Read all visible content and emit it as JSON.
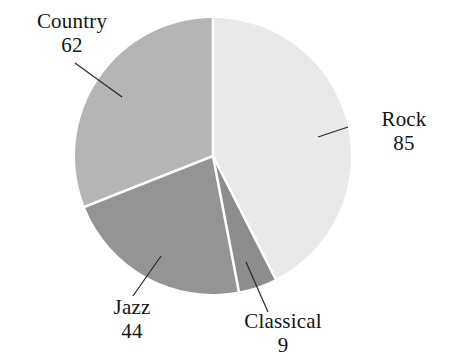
{
  "chart_data": {
    "type": "pie",
    "title": "",
    "subtitle": "",
    "xlabel": "",
    "ylabel": "",
    "categories": [
      "Rock",
      "Classical",
      "Jazz",
      "Country"
    ],
    "values": [
      85,
      9,
      44,
      62
    ],
    "total": 200,
    "start_angle_deg": 0,
    "direction": "clockwise",
    "legend": "none",
    "grid": false,
    "slices": [
      {
        "label": "Rock",
        "value": 85,
        "value_text": "85",
        "color": "#e9e9e9",
        "angle_deg": 153.0,
        "start_deg": 0.0,
        "end_deg": 153.0
      },
      {
        "label": "Classical",
        "value": 9,
        "value_text": "9",
        "color": "#8d8d8d",
        "angle_deg": 16.2,
        "start_deg": 153.0,
        "end_deg": 169.2
      },
      {
        "label": "Jazz",
        "value": 44,
        "value_text": "44",
        "color": "#949494",
        "angle_deg": 79.2,
        "start_deg": 169.2,
        "end_deg": 248.4
      },
      {
        "label": "Country",
        "value": 62,
        "value_text": "62",
        "color": "#b5b5b5",
        "angle_deg": 111.6,
        "start_deg": 248.4,
        "end_deg": 360.0
      }
    ],
    "separator_color": "#ffffff",
    "background_color": "#ffffff",
    "leader_line_color": "#2b2b2b"
  },
  "labels": {
    "country": {
      "name": "Country",
      "value": "62"
    },
    "rock": {
      "name": "Rock",
      "value": "85"
    },
    "jazz": {
      "name": "Jazz",
      "value": "44"
    },
    "classical": {
      "name": "Classical",
      "value": "9"
    }
  }
}
